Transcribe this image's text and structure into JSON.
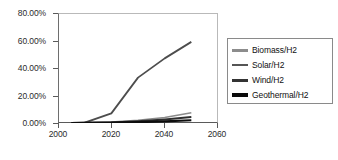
{
  "chart_data": {
    "type": "line",
    "title": "",
    "xlabel": "",
    "ylabel": "",
    "xlim": [
      2000,
      2060
    ],
    "ylim": [
      0,
      0.8
    ],
    "grid": false,
    "legend_position": "right",
    "x_ticks": [
      "2000",
      "2020",
      "2040",
      "2060"
    ],
    "x_tick_values": [
      2000,
      2020,
      2040,
      2060
    ],
    "y_ticks": [
      "0.00%",
      "20.00%",
      "40.00%",
      "60.00%",
      "80.00%"
    ],
    "y_tick_values": [
      0,
      20,
      40,
      60,
      80
    ],
    "x": [
      2005,
      2010,
      2020,
      2030,
      2040,
      2050
    ],
    "series": [
      {
        "name": "Biomass/H2",
        "color": "#8c8c8c",
        "width": 1.6,
        "values": [
          0.0,
          0.1,
          0.6,
          2.0,
          4.0,
          7.5
        ]
      },
      {
        "name": "Solar/H2",
        "color": "#4d4d4d",
        "width": 1.8,
        "values": [
          0.0,
          0.2,
          7.0,
          33.0,
          47.0,
          59.0
        ]
      },
      {
        "name": "Wind/H2",
        "color": "#2e2e2e",
        "width": 2.0,
        "values": [
          0.0,
          0.1,
          0.4,
          1.3,
          2.6,
          4.3
        ]
      },
      {
        "name": "Geothermal/H2",
        "color": "#0d0d0d",
        "width": 2.2,
        "values": [
          0.0,
          0.05,
          0.2,
          0.6,
          1.2,
          2.0
        ]
      }
    ]
  },
  "axes": {
    "y_tick_labels": [
      "80.00%",
      "60.00%",
      "40.00%",
      "20.00%",
      "0.00%"
    ],
    "x_tick_labels": [
      "2000",
      "2020",
      "2040",
      "2060"
    ]
  },
  "legend": {
    "items": [
      {
        "label": "Biomass/H2",
        "color": "#8c8c8c",
        "thickness": "3px"
      },
      {
        "label": "Solar/H2",
        "color": "#555555",
        "thickness": "2px"
      },
      {
        "label": "Wind/H2",
        "color": "#333333",
        "thickness": "3px"
      },
      {
        "label": "Geothermal/H2",
        "color": "#0a0a0a",
        "thickness": "4px"
      }
    ]
  }
}
